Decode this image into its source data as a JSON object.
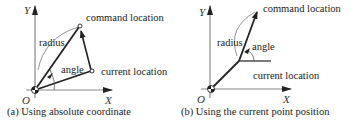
{
  "figure": {
    "panels": [
      {
        "id": "a",
        "caption": "(a) Using absolute coordinate",
        "axis_x_label": "X",
        "axis_y_label": "Y",
        "origin_label": "O",
        "labels": {
          "command": "command location",
          "current": "current location",
          "radius": "radius",
          "angle": "angle"
        },
        "colors": {
          "line": "#222222",
          "axis": "#888888"
        }
      },
      {
        "id": "b",
        "caption": "(b) Using the current point position",
        "axis_x_label": "X",
        "axis_y_label": "Y",
        "origin_label": "O",
        "labels": {
          "command": "command location",
          "current": "current location",
          "radius": "radius",
          "angle": "angle"
        },
        "colors": {
          "line": "#222222",
          "axis": "#888888"
        }
      }
    ]
  }
}
